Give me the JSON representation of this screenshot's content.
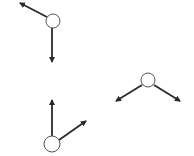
{
  "colors": {
    "background": "#ffffff",
    "stroke": "#2a2a2a",
    "node_fill": "#ffffff",
    "node_stroke": "#555555"
  },
  "nodes": [
    {
      "id": "node-1",
      "cx": 53,
      "cy": 21,
      "r": 7,
      "arrows": [
        {
          "direction": "up-left",
          "x1": 47,
          "y1": 17,
          "x2": 20,
          "y2": 3
        },
        {
          "direction": "down",
          "x1": 52,
          "y1": 28,
          "x2": 52,
          "y2": 62
        }
      ]
    },
    {
      "id": "node-2",
      "cx": 148,
      "cy": 80,
      "r": 7,
      "arrows": [
        {
          "direction": "down-left",
          "x1": 142,
          "y1": 85,
          "x2": 116,
          "y2": 101
        },
        {
          "direction": "down-right",
          "x1": 154,
          "y1": 85,
          "x2": 180,
          "y2": 101
        }
      ]
    },
    {
      "id": "node-3",
      "cx": 52,
      "cy": 144,
      "r": 8,
      "arrows": [
        {
          "direction": "up",
          "x1": 52,
          "y1": 136,
          "x2": 52,
          "y2": 100
        },
        {
          "direction": "up-right",
          "x1": 59,
          "y1": 140,
          "x2": 86,
          "y2": 121
        }
      ]
    }
  ]
}
